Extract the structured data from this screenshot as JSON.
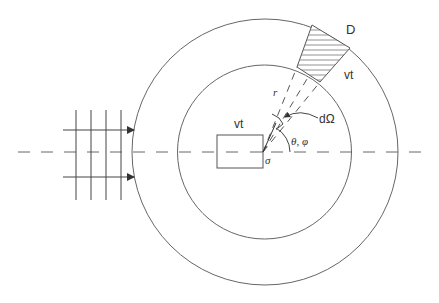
{
  "diagram": {
    "type": "scattering-geometry",
    "labels": {
      "detector": "D",
      "detector_volume": "vt",
      "sample_volume": "vt",
      "radius": "r",
      "solid_angle": "dΩ",
      "angles": "θ, φ",
      "cross_section": "σ"
    },
    "colors": {
      "line": "#555555",
      "text": "#333333",
      "background": "#ffffff"
    },
    "elements": [
      "incident plane wave (grid of wavefronts with two arrows)",
      "outer circle",
      "inner circle",
      "central sample rectangle",
      "hatched detector wedge",
      "dashed rays to detector",
      "horizontal dashed beam axis"
    ]
  }
}
